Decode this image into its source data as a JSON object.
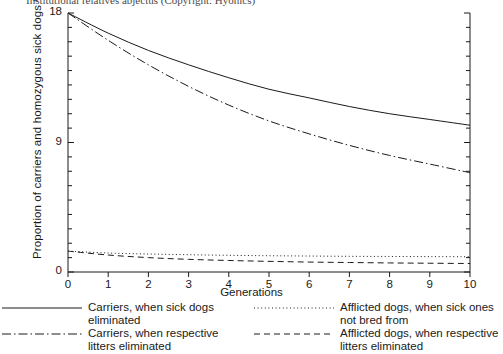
{
  "top_caption": "Institutional relatives abjectus (Copyright: Hyonics)",
  "chart_data": {
    "type": "line",
    "title": "",
    "xlabel": "Generations",
    "ylabel": "Proportion of carriers and homozygous sick dogs %",
    "xlim": [
      0,
      10
    ],
    "ylim": [
      0,
      18
    ],
    "xticks": [
      0,
      1,
      2,
      3,
      4,
      5,
      6,
      7,
      8,
      9,
      10
    ],
    "xtick_labels": [
      "0",
      "1",
      "2",
      "3",
      "4",
      "5",
      "6",
      "7",
      "8",
      "9",
      "10"
    ],
    "yticks": [
      0,
      9,
      18
    ],
    "ytick_labels": [
      "0",
      "9",
      "18"
    ],
    "y_minor_tick_step": 1,
    "grid": false,
    "legend_position": "below-plot-two-columns",
    "x": [
      0,
      1,
      2,
      3,
      4,
      5,
      6,
      7,
      8,
      9,
      10
    ],
    "series": [
      {
        "name": "Carriers, when sick dogs eliminated",
        "style": "solid",
        "color": "#1a1a1a",
        "values": [
          18.0,
          16.6,
          15.4,
          14.4,
          13.5,
          12.7,
          12.1,
          11.5,
          11.0,
          10.6,
          10.2
        ]
      },
      {
        "name": "Carriers, when respective litters eliminated",
        "style": "dash-dot",
        "color": "#1a1a1a",
        "values": [
          18.0,
          16.1,
          14.4,
          12.9,
          11.6,
          10.5,
          9.6,
          8.8,
          8.1,
          7.5,
          6.9
        ]
      },
      {
        "name": "Afflicted dogs, when sick ones not bred from",
        "style": "dotted",
        "color": "#1a1a1a",
        "values": [
          1.45,
          1.32,
          1.25,
          1.2,
          1.16,
          1.13,
          1.11,
          1.09,
          1.08,
          1.07,
          1.06
        ]
      },
      {
        "name": "Afflicted dogs, when respective litters eliminated",
        "style": "dashed",
        "color": "#1a1a1a",
        "values": [
          1.45,
          1.18,
          1.0,
          0.88,
          0.8,
          0.74,
          0.69,
          0.66,
          0.63,
          0.61,
          0.59
        ]
      }
    ]
  },
  "legend": {
    "left": [
      {
        "style": "solid",
        "label": "Carriers, when sick dogs\neliminated"
      },
      {
        "style": "dash-dot",
        "label": "Carriers, when respective\nlitters eliminated"
      }
    ],
    "right": [
      {
        "style": "dotted",
        "label": "Afflicted dogs, when sick ones\nnot bred from"
      },
      {
        "style": "dashed",
        "label": "Afflicted dogs, when respective\nlitters eliminated"
      }
    ]
  }
}
